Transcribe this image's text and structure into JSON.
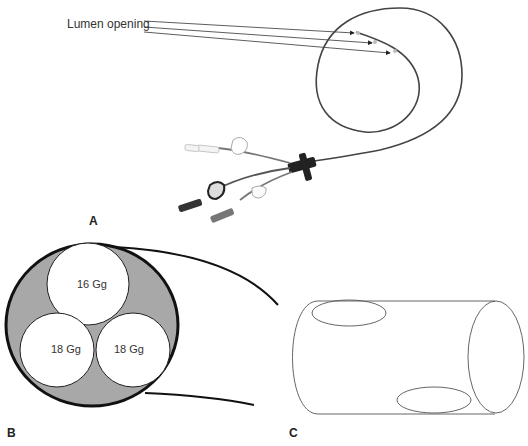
{
  "figure": {
    "panel_a": {
      "letter": "A",
      "annotation": "Lumen opening",
      "arrow_count": 3
    },
    "panel_b": {
      "letter": "B",
      "lumens": [
        {
          "label": "16 Gg"
        },
        {
          "label": "18 Gg"
        },
        {
          "label": "18 Gg"
        }
      ],
      "fill_color": "#a8a8a8"
    },
    "panel_c": {
      "letter": "C"
    }
  }
}
